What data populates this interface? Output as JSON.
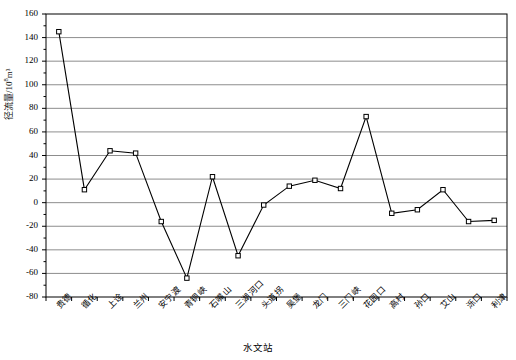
{
  "chart_data": {
    "type": "line",
    "title": "",
    "xlabel": "水文站",
    "ylabel": "径流量/10⁸m³",
    "ylabel_main": "径流量/10",
    "ylabel_exponent": "8",
    "ylabel_unit_tail": "m³",
    "ylim": [
      -80,
      160
    ],
    "ytick_step": 20,
    "yticks": [
      160,
      140,
      120,
      100,
      80,
      60,
      40,
      20,
      0,
      -20,
      -40,
      -60,
      -80
    ],
    "ytick_labels": [
      "160",
      "140",
      "120",
      "100",
      "80",
      "60",
      "40",
      "20",
      "0",
      "-20",
      "-40",
      "-60",
      "-80"
    ],
    "grid": true,
    "grid_axis": "y",
    "legend": false,
    "marker": "open-square",
    "line_color": "#000000",
    "grid_color": "#808080",
    "axis_color": "#000000",
    "categories": [
      "贵德",
      "循化",
      "上诠",
      "兰州",
      "安宁渡",
      "青铜峡",
      "石嘴山",
      "三湖河口",
      "头道拐",
      "吴堡",
      "龙门",
      "三门峡",
      "花园口",
      "高村",
      "孙口",
      "艾山",
      "泺口",
      "利津"
    ],
    "values": [
      145,
      11,
      44,
      42,
      -16,
      -64,
      22,
      -45,
      -2,
      14,
      19,
      12,
      73,
      -9,
      -6,
      11,
      -16,
      -15
    ],
    "series": [
      {
        "name": "径流量",
        "values": [
          145,
          11,
          44,
          42,
          -16,
          -64,
          22,
          -45,
          -2,
          14,
          19,
          12,
          73,
          -9,
          -6,
          11,
          -16,
          -15
        ]
      }
    ]
  }
}
